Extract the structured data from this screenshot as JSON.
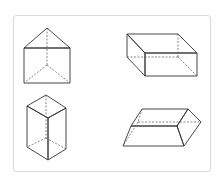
{
  "figure": {
    "colors": {
      "top_face": "#e8e8e8",
      "front_face": "#cacaca",
      "side_face": "#a9a9a9",
      "edge": "#333333",
      "frame_border": "#d9d9d9"
    },
    "shapes": [
      {
        "name": "triangular-prism",
        "position": "top-left"
      },
      {
        "name": "rectangular-cuboid-flat",
        "position": "top-right"
      },
      {
        "name": "rhombic-prism-upright",
        "position": "bottom-left"
      },
      {
        "name": "trapezoidal-prism",
        "position": "bottom-right"
      }
    ]
  }
}
